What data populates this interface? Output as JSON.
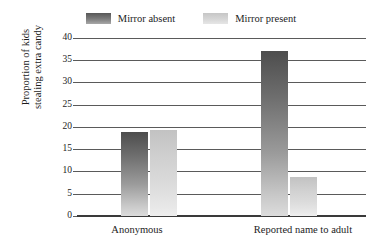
{
  "chart_data": {
    "type": "bar",
    "title": "",
    "subtitle": "",
    "xlabel": "",
    "ylabel": "Proportion of kids stealing extra candy",
    "ylabel_lines": [
      "Proportion of kids",
      "stealing extra candy"
    ],
    "categories": [
      "Anonymous",
      "Reported name to adult"
    ],
    "series": [
      {
        "name": "Mirror absent",
        "values": [
          19,
          37.3
        ],
        "color": "#6e6e6e"
      },
      {
        "name": "Mirror present",
        "values": [
          19.5,
          8.8
        ],
        "color": "#d4d4d4"
      }
    ],
    "ylim": [
      0,
      40
    ],
    "yticks": [
      0,
      5,
      10,
      15,
      20,
      25,
      30,
      35,
      40
    ],
    "ytick_labels": [
      "0",
      "5",
      "10",
      "15",
      "20",
      "25",
      "30",
      "35",
      "40"
    ],
    "grid": true,
    "grid_axis": "y",
    "legend_position": "top-center"
  },
  "legend": {
    "entries": [
      {
        "label": "Mirror absent",
        "swatch": "dark-gradient-swatch"
      },
      {
        "label": "Mirror present",
        "swatch": "light-gradient-swatch"
      }
    ]
  },
  "axes": {
    "y_title_line1": "Proportion of kids",
    "y_title_line2": "stealing extra candy",
    "y_ticks": [
      "40",
      "35",
      "30",
      "25",
      "20",
      "15",
      "10",
      "5",
      "0"
    ],
    "x_categories": [
      "Anonymous",
      "Reported name to adult"
    ]
  }
}
